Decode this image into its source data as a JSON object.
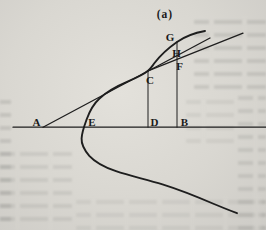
{
  "figure": {
    "caption": "(a)",
    "points": {
      "A": "A",
      "B": "B",
      "C": "C",
      "D": "D",
      "E": "E",
      "F": "F",
      "G": "G",
      "H": "H"
    },
    "colors": {
      "ink": "#1e1e1e",
      "paper": "#d9d7d1"
    },
    "paths": {
      "axis": "M 13 127.2 L 266 127.2",
      "curve": "M 205 31 C 195 32.8 185.5 36 177 42 C 169 47.6 161 54.5 154.5 63 C 152 66.3 151 68.3 148 70.8 C 144.5 73.7 136 78 127.5 81.6 C 117.5 85.8 107 91.5 99.5 98.5 C 93.5 104 89.7 111 86.8 119 C 84.6 125 82 131.5 81.6 138.5 C 81.3 144 84.3 150 89.3 155.8 C 95.5 162.6 104.5 167.2 116 171.2 C 129.5 175.8 146 179.3 162.5 184.3 C 180 189.8 197.5 196.8 214 204 C 221.5 207.2 229.5 210.3 237 213.2",
      "tangent_from_A": "M 43 127.2 L 210 38",
      "tangent_at_C": "M 148 70.8 L 243 33.2",
      "ordinate_CD": "M 148 70.8 L 148 127.2",
      "ordinate_GB": "M 177 41.8 L 177 127.2"
    }
  }
}
